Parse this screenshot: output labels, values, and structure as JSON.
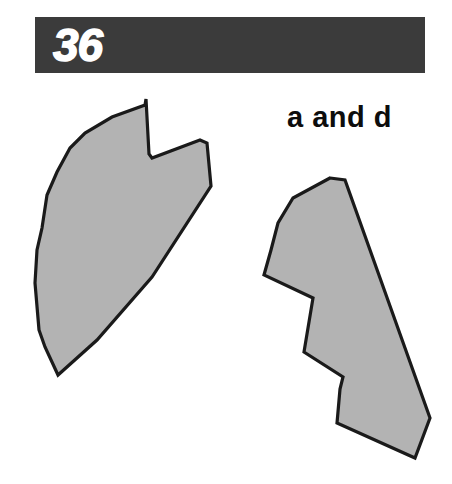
{
  "page": {
    "width": 452,
    "height": 484,
    "background_color": "#ffffff"
  },
  "header": {
    "number": "36",
    "bar_color": "#3b3b3b",
    "number_color": "#ffffff"
  },
  "answer": {
    "caption": "a and d",
    "color": "#0d0d0d"
  },
  "figure": {
    "fill_color": "#b3b3b3",
    "outline_color": "#1a1a1a",
    "shape_count": 2,
    "shapes": [
      {
        "name": "left-fan-shape",
        "points": "146,99 149,154 152,158 200,140 207,143 211,186 152,277 97,340 58,375 45,347 39,330 35,283 37,250 42,228 47,195 57,172 70,148 85,133 112,117 145,105"
      },
      {
        "name": "right-arrow-shape",
        "points": "330,178 345,180 430,418 415,458 337,423 340,389 343,377 304,352 313,298 264,275 271,250 278,223 293,198"
      }
    ]
  }
}
